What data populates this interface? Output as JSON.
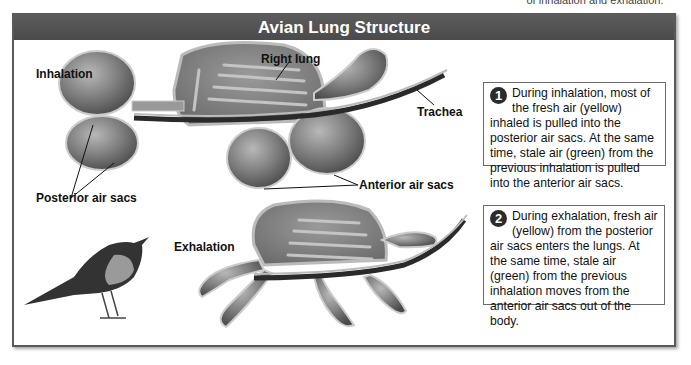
{
  "cut_caption": "of inhalation and exhalation.",
  "figure": {
    "title": "Avian Lung Structure",
    "labels": {
      "inhalation": "Inhalation",
      "exhalation": "Exhalation",
      "right_lung": "Right lung",
      "trachea": "Trachea",
      "posterior_air_sacs": "Posterior air sacs",
      "anterior_air_sacs": "Anterior air sacs"
    },
    "callouts": [
      {
        "number": "1",
        "text": "During inhalation, most of the fresh air (yellow) inhaled is pulled into the posterior air sacs. At the same time, stale air (green) from the previous inhalation is pulled into the anterior air sacs."
      },
      {
        "number": "2",
        "text": "During exhalation, fresh air (yellow) from the posterior air sacs enters the lungs. At the same time, stale air (green) from the previous inhalation moves from the anterior air sacs out of the body."
      }
    ],
    "colors": {
      "title_bar": "#505050",
      "border": "#5a5a5a",
      "sac_fill": "#8a8a8a",
      "callout_number_bg": "#2b2b2b"
    }
  }
}
